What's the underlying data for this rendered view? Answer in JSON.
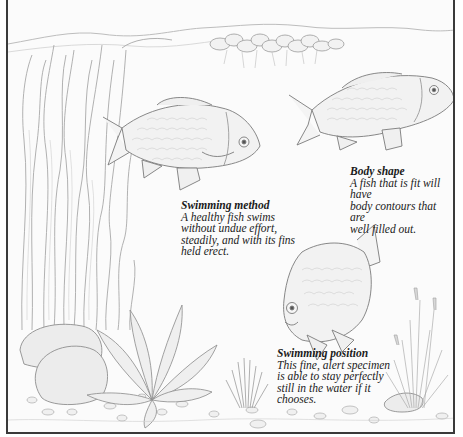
{
  "page": {
    "intro_left": "So when you choose a new specimen for",
    "intro_right": "illustration below."
  },
  "illustration": {
    "description": "Pencil drawing of an aquarium with three healthy barb fish, tall vallisneria plants, floating plants at the surface, rocks, gravel and grasses",
    "colors": {
      "border": "#3a3a3a",
      "line": "#8a8a8a",
      "shade": "#c8c8c8",
      "text": "#1a1a1a"
    }
  },
  "captions": [
    {
      "id": "swimming-method",
      "title": "Swimming method",
      "lines": [
        "A healthy fish swims",
        "without undue effort,",
        "steadily, and with its fins",
        "held erect."
      ]
    },
    {
      "id": "body-shape",
      "title": "Body shape",
      "lines": [
        "A fish that is fit will have",
        "body contours that are",
        "well filled out."
      ]
    },
    {
      "id": "swimming-position",
      "title": "Swimming position",
      "lines": [
        "This fine, alert specimen",
        "is able to stay perfectly",
        "still in the water if it",
        "chooses."
      ]
    }
  ]
}
